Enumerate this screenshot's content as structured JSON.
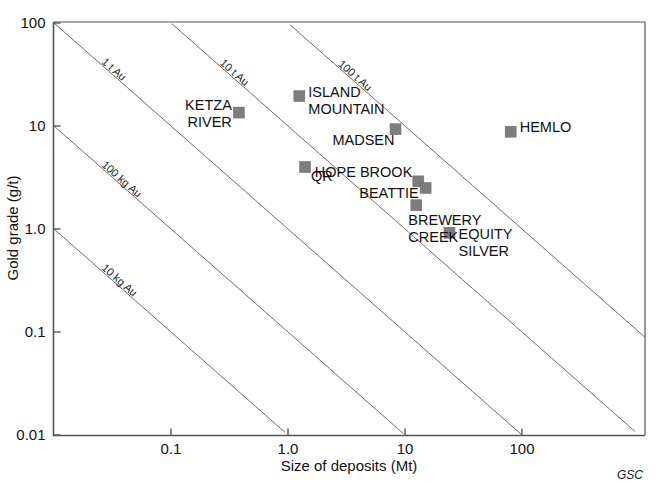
{
  "chart_data": {
    "type": "scatter",
    "title": "",
    "xlabel": "Size of deposits (Mt)",
    "ylabel": "Gold grade (g/t)",
    "xscale": "log",
    "yscale": "log",
    "xlim": [
      0.035,
      400
    ],
    "ylim": [
      0.01,
      100
    ],
    "grid": false,
    "legend": "none",
    "xticks": [
      "0.1",
      "1.0",
      "10",
      "100"
    ],
    "xtick_values": [
      0.1,
      1.0,
      10,
      100
    ],
    "yticks": [
      "0.01",
      "0.1",
      "1.0",
      "10",
      "100"
    ],
    "ytick_values": [
      0.01,
      0.1,
      1.0,
      10,
      100
    ],
    "points": [
      {
        "name": "KETZA RIVER",
        "label": "KETZA\nRIVER",
        "x": 0.38,
        "y": 13.5
      },
      {
        "name": "ISLAND MOUNTAIN",
        "label": "ISLAND\nMOUNTAIN",
        "x": 1.25,
        "y": 19.5
      },
      {
        "name": "QR",
        "label": "QR",
        "x": 1.4,
        "y": 4.0
      },
      {
        "name": "MADSEN",
        "label": "MADSEN",
        "x": 8.3,
        "y": 9.3
      },
      {
        "name": "HOPE BROOK",
        "label": "HOPE BROOK",
        "x": 13.0,
        "y": 2.9
      },
      {
        "name": "BEATTIE",
        "label": "BEATTIE",
        "x": 15.0,
        "y": 2.5
      },
      {
        "name": "BREWERY CREEK",
        "label": "BREWERY\nCREEK",
        "x": 12.5,
        "y": 1.7
      },
      {
        "name": "EQUITY SILVER",
        "label": "EQUITY\nSILVER",
        "x": 24.0,
        "y": 0.92
      },
      {
        "name": "HEMLO",
        "label": "HEMLO",
        "x": 80.0,
        "y": 8.8
      }
    ],
    "contour_lines": [
      {
        "label": "10 kg Au",
        "tonnes": 0.01
      },
      {
        "label": "100 kg Au",
        "tonnes": 0.1
      },
      {
        "label": "1 t Au",
        "tonnes": 1
      },
      {
        "label": "10 t Au",
        "tonnes": 10
      },
      {
        "label": "100 t Au",
        "tonnes": 100
      }
    ],
    "annotations": [
      "GSC"
    ]
  },
  "credit": "GSC"
}
